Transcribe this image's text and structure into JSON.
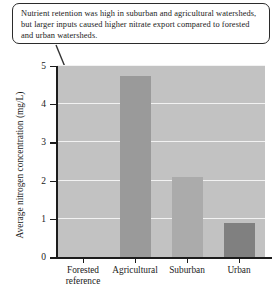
{
  "annotation": {
    "text": "Nutrient retention was high in suburban and agricultural watersheds, but larger inputs caused higher nitrate export compared to forested and urban watersheds.",
    "leader_line": "callout-leader-line"
  },
  "chart_data": {
    "type": "bar",
    "title": "",
    "xlabel": "",
    "ylabel": "Average nitrogen concentration (mg/L)",
    "categories": [
      "Forested reference",
      "Agricultural",
      "Suburban",
      "Urban"
    ],
    "values": [
      0.0,
      4.75,
      2.1,
      0.88
    ],
    "ylim": [
      0,
      5
    ],
    "yticks": [
      0,
      1,
      2,
      3,
      4,
      5
    ],
    "ytick_labels": [
      "0",
      "1",
      "2",
      "3",
      "4",
      "5"
    ],
    "grid": true,
    "legend": "none",
    "bar_colors": [
      "#c2c2c2",
      "#9a9a9a",
      "#ababab",
      "#808080"
    ],
    "plot_background": "#c2c2c2",
    "gridline_color": "#f2f2f2",
    "axis_color": "#1c1c1c"
  }
}
